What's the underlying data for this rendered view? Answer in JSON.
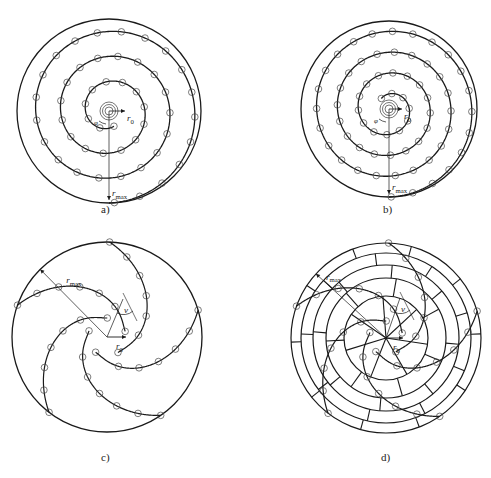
{
  "figure": {
    "panels": [
      {
        "id": "a",
        "caption": "a)",
        "type": "archimedean-spiral",
        "labels": {
          "r0": "r",
          "r0_sub": "0",
          "rmax": "r",
          "rmax_sub": "max",
          "phi": "φ"
        }
      },
      {
        "id": "b",
        "caption": "b)",
        "type": "archimedean-spiral-denser",
        "labels": {
          "r0": "r",
          "r0_sub": "0",
          "rmax": "r",
          "rmax_sub": "max",
          "phi": "φ"
        }
      },
      {
        "id": "c",
        "caption": "c)",
        "type": "multi-arm-spiral",
        "labels": {
          "rmax": "r",
          "rmax_sub": "max",
          "r0": "r",
          "r0_sub": "0",
          "nu": "ν"
        }
      },
      {
        "id": "d",
        "caption": "d)",
        "type": "multi-arm-spiral-on-ring-grid",
        "labels": {
          "rmax": "r",
          "rmax_sub": "max",
          "r0": "r",
          "r0_sub": "0",
          "nu": "ν"
        }
      }
    ]
  },
  "colors": {
    "stroke": "#1a1a1a",
    "background": "#ffffff"
  }
}
